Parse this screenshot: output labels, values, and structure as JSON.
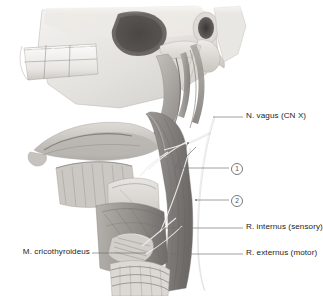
{
  "figure": {
    "type": "anatomical-illustration",
    "style": "grayscale pencil/airbrush medical illustration",
    "background_color": "#ffffff",
    "ink_color": "#1d1d1d",
    "leader_color": "#6e6e6e"
  },
  "labels": {
    "vagus": {
      "text": "N. vagus (CN X)",
      "side": "right"
    },
    "key_one": {
      "text": "1",
      "side": "right"
    },
    "key_two": {
      "text": "2",
      "side": "right"
    },
    "internus": {
      "text": "R. internus (sensory)",
      "side": "right"
    },
    "externus": {
      "text": "R. externus (motor)",
      "side": "right"
    },
    "cricothyroideus": {
      "text": "M. cricothyroideus",
      "side": "left"
    }
  },
  "anatomy_regions": [
    {
      "name": "maxilla-with-molars",
      "label": "upper molar teeth in maxilla"
    },
    {
      "name": "zygomatic-arch",
      "label": "zygomatic arch"
    },
    {
      "name": "external-acoustic-meatus",
      "label": "external acoustic meatus"
    },
    {
      "name": "mastoid-process",
      "label": "mastoid process"
    },
    {
      "name": "styloid-process",
      "label": "styloid process"
    },
    {
      "name": "mandible-ramus",
      "label": "ramus of mandible"
    },
    {
      "name": "hyoid-bone",
      "label": "hyoid bone"
    },
    {
      "name": "thyroid-cartilage",
      "label": "thyroid cartilage"
    },
    {
      "name": "cricothyroid-muscle",
      "label": "cricothyroid muscle"
    },
    {
      "name": "trachea-rings",
      "label": "tracheal cartilage rings"
    },
    {
      "name": "sternocleidomastoid",
      "label": "sternocleidomastoid muscle"
    },
    {
      "name": "carotid-sheath-nerve",
      "label": "vagus nerve trunk in carotid sheath"
    }
  ]
}
